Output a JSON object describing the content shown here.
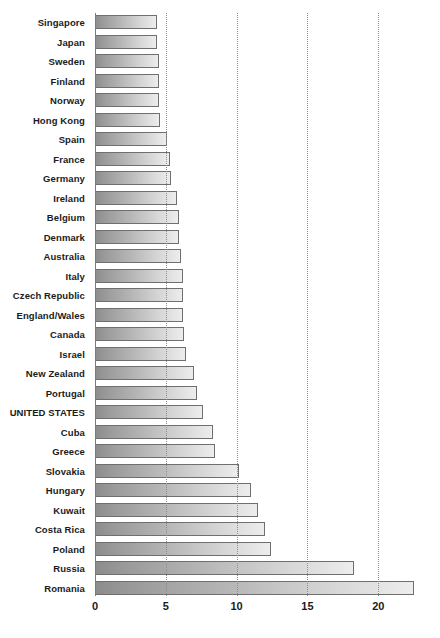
{
  "chart_data": {
    "type": "bar",
    "orientation": "horizontal",
    "title": "",
    "subtitle": "",
    "xlabel": "",
    "ylabel": "",
    "xlim": [
      0,
      23.3
    ],
    "ylim": null,
    "grid": true,
    "grid_axis": "x",
    "legend": false,
    "legend_position": "none",
    "xticks": [
      0,
      5,
      10,
      15,
      20
    ],
    "xtick_labels": [
      "0",
      "5",
      "10",
      "15",
      "20"
    ],
    "highlighted_category": "UNITED STATES",
    "categories": [
      "Singapore",
      "Japan",
      "Sweden",
      "Finland",
      "Norway",
      "Hong Kong",
      "Spain",
      "France",
      "Germany",
      "Ireland",
      "Belgium",
      "Denmark",
      "Australia",
      "Italy",
      "Czech Republic",
      "England/Wales",
      "Canada",
      "Israel",
      "New Zealand",
      "Portugal",
      "UNITED STATES",
      "Cuba",
      "Greece",
      "Slovakia",
      "Hungary",
      "Kuwait",
      "Costa Rica",
      "Poland",
      "Russia",
      "Romania"
    ],
    "values": [
      4.4,
      4.4,
      4.5,
      4.5,
      4.5,
      4.6,
      5.1,
      5.3,
      5.4,
      5.8,
      5.9,
      5.9,
      6.1,
      6.2,
      6.2,
      6.2,
      6.3,
      6.4,
      7.0,
      7.2,
      7.6,
      8.3,
      8.5,
      10.2,
      11.0,
      11.5,
      12.0,
      12.4,
      18.3,
      22.5
    ]
  },
  "style": {
    "bar_fill_dark": "#8c8c8c",
    "bar_fill_light": "#ededed",
    "bar_border": "#6f6f6f",
    "axis_color": "#7a7a7a",
    "grid_color": "#8e8e8e",
    "text_color": "#1b1b1b",
    "background": "#ffffff"
  }
}
